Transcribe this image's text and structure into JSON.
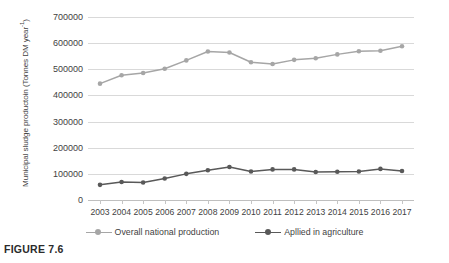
{
  "caption": "FIGURE 7.6",
  "chart_data": {
    "type": "line",
    "title": "",
    "xlabel": "",
    "ylabel": "Municipal sludge productoin (Tonnes DM year-1)",
    "ylabel_main": "Municipal sludge productoin (Tonnes DM",
    "ylabel_sub": "year",
    "ylabel_exp": "-1",
    "ylabel_tail": ")",
    "grid": true,
    "legend_position": "bottom",
    "ylim": [
      0,
      700000
    ],
    "yticks": [
      0,
      100000,
      200000,
      300000,
      400000,
      500000,
      600000,
      700000
    ],
    "ytick_labels": [
      "0",
      "100000",
      "200000",
      "300000",
      "400000",
      "500000",
      "600000",
      "700000"
    ],
    "categories": [
      "2003",
      "2004",
      "2005",
      "2006",
      "2007",
      "2008",
      "2009",
      "2010",
      "2011",
      "2012",
      "2013",
      "2014",
      "2015",
      "2016",
      "2017"
    ],
    "series": [
      {
        "name": "Overall national production",
        "color": "#a6a6a6",
        "marker": "circle",
        "values": [
          445000,
          477000,
          486000,
          502000,
          534000,
          568000,
          564000,
          527000,
          520000,
          536000,
          542000,
          557000,
          569000,
          571000,
          588000
        ]
      },
      {
        "name": "Apllied in agriculture",
        "color": "#595959",
        "marker": "circle",
        "values": [
          58000,
          69000,
          67000,
          82000,
          100000,
          114000,
          126000,
          109000,
          117000,
          117000,
          107000,
          108000,
          109000,
          119000,
          111000
        ]
      }
    ]
  }
}
